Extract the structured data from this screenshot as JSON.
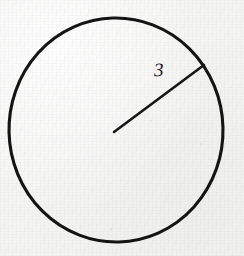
{
  "figure": {
    "kind": "geometry-diagram",
    "medium": "scanned-textbook-page",
    "background_color": "#f4f4f3",
    "ink_color": "#161616",
    "canvas": {
      "width": 244,
      "height": 256
    },
    "labels": {
      "radius_length": "3"
    },
    "shapes": {
      "circle": {
        "name": "circle-outline",
        "center_x": 116,
        "center_y": 130,
        "radius_x": 107,
        "radius_y": 112,
        "stroke_width": 3.1,
        "stroke_color": "#141414",
        "fill": "none"
      },
      "radius_segment": {
        "name": "radius-line",
        "x1": 114,
        "y1": 132,
        "x2": 204,
        "y2": 65,
        "stroke_width": 2.6,
        "stroke_color": "#161616"
      }
    },
    "label_positions": {
      "radius_length": {
        "x": 154,
        "y": 60
      }
    },
    "specks": [
      {
        "x": 92,
        "y": 52,
        "size": 2.0,
        "opacity": 0.22
      },
      {
        "x": 63,
        "y": 97,
        "size": 1.5,
        "opacity": 0.18
      },
      {
        "x": 150,
        "y": 120,
        "size": 1.6,
        "opacity": 0.2
      },
      {
        "x": 110,
        "y": 228,
        "size": 1.8,
        "opacity": 0.24
      },
      {
        "x": 176,
        "y": 186,
        "size": 1.4,
        "opacity": 0.17
      },
      {
        "x": 41,
        "y": 163,
        "size": 1.3,
        "opacity": 0.15
      },
      {
        "x": 200,
        "y": 143,
        "size": 1.5,
        "opacity": 0.16
      },
      {
        "x": 133,
        "y": 172,
        "size": 1.2,
        "opacity": 0.14
      }
    ]
  }
}
